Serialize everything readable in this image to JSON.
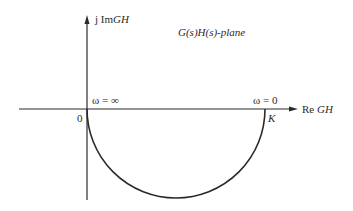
{
  "diagram": {
    "type": "nyquist-plot",
    "plane_label": "G(s)H(s)-plane",
    "axes": {
      "imaginary": {
        "prefix": "j Im",
        "var": "GH"
      },
      "real": {
        "prefix": "Re ",
        "var": "GH"
      }
    },
    "points": {
      "origin": {
        "label": "0",
        "annotation": "ω = ∞"
      },
      "k_point": {
        "label": "K",
        "annotation": "ω = 0"
      }
    },
    "curve": {
      "shape": "semicircle-lower-half",
      "from": "0",
      "to": "K"
    },
    "colors": {
      "stroke": "#2a2a2a",
      "background": "#ffffff"
    }
  }
}
